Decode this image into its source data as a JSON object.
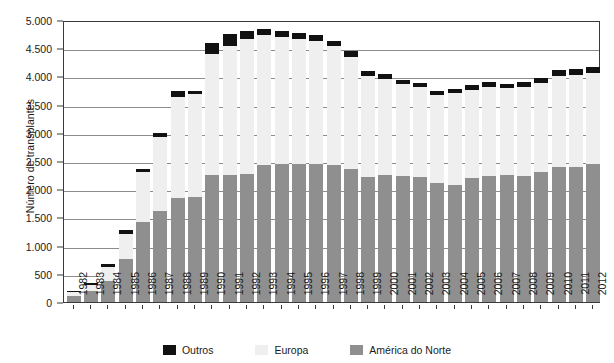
{
  "chart_data": {
    "type": "bar",
    "stacked": true,
    "title": "",
    "xlabel": "",
    "ylabel": "Número de transplantes",
    "ylim": [
      0,
      5000
    ],
    "ytick_values": [
      0,
      500,
      1000,
      1500,
      2000,
      2500,
      3000,
      3500,
      4000,
      4500,
      5000
    ],
    "ytick_labels": [
      "0",
      "500",
      "1.000",
      "1.500",
      "2.000",
      "2.500",
      "3.000",
      "3.500",
      "4.000",
      "4.500",
      "5.000"
    ],
    "grid": true,
    "legend_position": "bottom",
    "categories": [
      "1982",
      "1983",
      "1984",
      "1985",
      "1986",
      "1987",
      "1988",
      "1989",
      "1990",
      "1991",
      "1992",
      "1993",
      "1994",
      "1995",
      "1996",
      "1997",
      "1998",
      "1999",
      "2000",
      "2001",
      "2002",
      "2003",
      "2004",
      "2005",
      "2006",
      "2007",
      "2008",
      "2009",
      "2010",
      "2011",
      "2012"
    ],
    "series": [
      {
        "name": "América do Norte",
        "color": "#8f8f8f",
        "values": [
          110,
          190,
          370,
          760,
          1410,
          1620,
          1840,
          1860,
          2250,
          2260,
          2270,
          2430,
          2440,
          2450,
          2440,
          2430,
          2360,
          2220,
          2250,
          2230,
          2210,
          2110,
          2080,
          2200,
          2230,
          2250,
          2230,
          2300,
          2400,
          2400,
          2450
        ]
      },
      {
        "name": "Europa",
        "color": "#efefef",
        "values": [
          60,
          120,
          250,
          440,
          900,
          1300,
          1800,
          1830,
          2150,
          2280,
          2400,
          2300,
          2260,
          2210,
          2190,
          2110,
          1990,
          1780,
          1700,
          1630,
          1600,
          1560,
          1620,
          1560,
          1590,
          1540,
          1590,
          1580,
          1610,
          1620,
          1610
        ]
      },
      {
        "name": "Outros",
        "color": "#111111",
        "values": [
          30,
          30,
          50,
          70,
          50,
          70,
          100,
          60,
          190,
          210,
          130,
          110,
          100,
          110,
          100,
          90,
          100,
          90,
          100,
          80,
          80,
          70,
          70,
          80,
          80,
          80,
          80,
          90,
          100,
          110,
          110
        ]
      }
    ],
    "totals": [
      200,
      340,
      670,
      1270,
      2360,
      2990,
      3740,
      3750,
      4590,
      4750,
      4800,
      4840,
      4800,
      4770,
      4730,
      4630,
      4450,
      4090,
      4050,
      3940,
      3890,
      3740,
      3770,
      3840,
      3900,
      3870,
      3900,
      3970,
      4110,
      4130,
      4170
    ]
  },
  "legend": {
    "items": [
      {
        "label": "Outros",
        "swatch": "black"
      },
      {
        "label": "Europa",
        "swatch": "light-gray"
      },
      {
        "label": "América do Norte",
        "swatch": "gray"
      }
    ]
  }
}
